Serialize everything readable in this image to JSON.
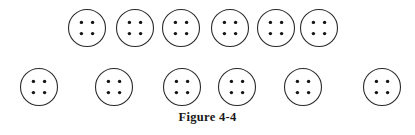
{
  "figure": {
    "caption": "Figure 4-4",
    "colors": {
      "background": "#ffffff",
      "outline": "#2b2b2b",
      "hole": "#141414",
      "caption_text": "#191919"
    },
    "geometry": {
      "circle_radius": 18.5,
      "outline_width": 1.1,
      "hole_radius": 1.7,
      "hole_offset": 5.6
    },
    "rows": [
      {
        "name": "top-row",
        "label": "Top row of buttons",
        "count": 6,
        "center_y": 28,
        "buttons": [
          {
            "label": "button-1",
            "cx": 87,
            "holes": 4
          },
          {
            "label": "button-2",
            "cx": 135,
            "holes": 4
          },
          {
            "label": "button-3",
            "cx": 181,
            "holes": 4
          },
          {
            "label": "button-4",
            "cx": 230,
            "holes": 4
          },
          {
            "label": "button-5",
            "cx": 276,
            "holes": 4
          },
          {
            "label": "button-6",
            "cx": 319,
            "holes": 4
          }
        ]
      },
      {
        "name": "bottom-row",
        "label": "Bottom row of buttons",
        "count": 6,
        "center_y": 87,
        "buttons": [
          {
            "label": "button-7",
            "cx": 39,
            "holes": 4
          },
          {
            "label": "button-8",
            "cx": 114,
            "holes": 4
          },
          {
            "label": "button-9",
            "cx": 182,
            "holes": 4
          },
          {
            "label": "button-10",
            "cx": 237,
            "holes": 4
          },
          {
            "label": "button-11",
            "cx": 303,
            "holes": 4
          },
          {
            "label": "button-12",
            "cx": 382,
            "holes": 4
          }
        ]
      }
    ]
  }
}
